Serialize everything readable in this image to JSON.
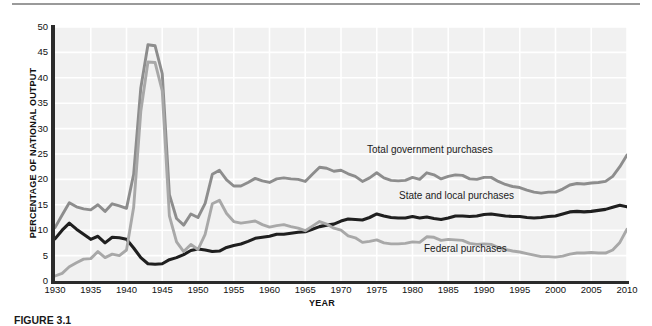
{
  "figure": {
    "caption": "FIGURE 3.1",
    "y_axis_title": "PERCENTAGE OF NATIONAL OUTPUT",
    "x_axis_title": "YEAR"
  },
  "colors": {
    "total_government": "#8d8d8d",
    "state_local": "#1f1f1f",
    "federal": "#a8a8a8",
    "plot_background": "#f1f1f1",
    "gridline": "#ffffff",
    "axis": "#2b2b2b"
  },
  "chart_data": {
    "type": "line",
    "title": "",
    "xlabel": "YEAR",
    "ylabel": "PERCENTAGE OF NATIONAL OUTPUT",
    "xlim": [
      1930,
      2010
    ],
    "ylim": [
      0,
      50
    ],
    "grid": true,
    "legend_position": "inline-annotations",
    "xticks": [
      1930,
      1935,
      1940,
      1945,
      1950,
      1955,
      1960,
      1965,
      1970,
      1975,
      1980,
      1985,
      1990,
      1995,
      2000,
      2005,
      2010
    ],
    "yticks": [
      0,
      5,
      10,
      15,
      20,
      25,
      30,
      35,
      40,
      45,
      50
    ],
    "x": [
      1930,
      1931,
      1932,
      1933,
      1934,
      1935,
      1936,
      1937,
      1938,
      1939,
      1940,
      1941,
      1942,
      1943,
      1944,
      1945,
      1946,
      1947,
      1948,
      1949,
      1950,
      1951,
      1952,
      1953,
      1954,
      1955,
      1956,
      1957,
      1958,
      1959,
      1960,
      1961,
      1962,
      1963,
      1964,
      1965,
      1966,
      1967,
      1968,
      1969,
      1970,
      1971,
      1972,
      1973,
      1974,
      1975,
      1976,
      1977,
      1978,
      1979,
      1980,
      1981,
      1982,
      1983,
      1984,
      1985,
      1986,
      1987,
      1988,
      1989,
      1990,
      1991,
      1992,
      1993,
      1994,
      1995,
      1996,
      1997,
      1998,
      1999,
      2000,
      2001,
      2002,
      2003,
      2004,
      2005,
      2006,
      2007,
      2008,
      2009,
      2010
    ],
    "series": [
      {
        "name": "Total government purchases",
        "color": "#8d8d8d",
        "values": [
          10.5,
          13.0,
          15.4,
          14.6,
          14.2,
          14.0,
          15.0,
          13.7,
          15.2,
          14.8,
          14.3,
          21.0,
          38.0,
          46.5,
          46.3,
          40.8,
          17.0,
          12.3,
          11.0,
          13.2,
          12.5,
          15.3,
          21.0,
          21.8,
          19.9,
          18.7,
          18.7,
          19.4,
          20.2,
          19.7,
          19.4,
          20.1,
          20.3,
          20.1,
          20.0,
          19.6,
          21.0,
          22.4,
          22.2,
          21.6,
          21.8,
          21.1,
          20.6,
          19.6,
          20.3,
          21.3,
          20.3,
          19.8,
          19.7,
          19.8,
          20.4,
          20.0,
          21.3,
          20.9,
          20.1,
          20.6,
          20.9,
          20.8,
          20.1,
          20.0,
          20.4,
          20.4,
          19.6,
          19.0,
          18.6,
          18.4,
          17.9,
          17.5,
          17.3,
          17.5,
          17.5,
          18.1,
          18.9,
          19.2,
          19.1,
          19.3,
          19.4,
          19.6,
          20.6,
          22.5,
          24.8
        ]
      },
      {
        "name": "State and local purchases",
        "color": "#1f1f1f",
        "values": [
          8.3,
          10.0,
          11.4,
          10.2,
          9.2,
          8.2,
          8.8,
          7.5,
          8.6,
          8.5,
          8.2,
          6.5,
          4.6,
          3.4,
          3.3,
          3.4,
          4.2,
          4.6,
          5.2,
          6.0,
          6.3,
          6.1,
          5.8,
          5.9,
          6.6,
          7.0,
          7.3,
          7.8,
          8.4,
          8.6,
          8.8,
          9.2,
          9.2,
          9.4,
          9.6,
          9.7,
          10.2,
          10.7,
          11.0,
          11.2,
          11.8,
          12.2,
          12.1,
          12.0,
          12.5,
          13.2,
          12.8,
          12.5,
          12.4,
          12.4,
          12.7,
          12.4,
          12.6,
          12.3,
          12.1,
          12.4,
          12.8,
          12.8,
          12.7,
          12.8,
          13.1,
          13.2,
          13.0,
          12.8,
          12.7,
          12.7,
          12.5,
          12.4,
          12.5,
          12.7,
          12.8,
          13.2,
          13.6,
          13.7,
          13.6,
          13.7,
          13.9,
          14.1,
          14.5,
          14.9,
          14.6
        ]
      },
      {
        "name": "Federal purchases",
        "color": "#a8a8a8",
        "values": [
          1.0,
          1.5,
          2.8,
          3.6,
          4.3,
          4.4,
          5.8,
          4.6,
          5.3,
          5.0,
          6.1,
          14.5,
          33.4,
          43.1,
          43.0,
          37.4,
          12.8,
          7.7,
          5.8,
          7.2,
          6.2,
          9.2,
          15.2,
          15.9,
          13.3,
          11.7,
          11.4,
          11.6,
          11.8,
          11.1,
          10.6,
          10.9,
          11.1,
          10.7,
          10.4,
          9.9,
          10.8,
          11.7,
          11.2,
          10.4,
          10.0,
          8.9,
          8.5,
          7.6,
          7.8,
          8.1,
          7.5,
          7.3,
          7.3,
          7.4,
          7.7,
          7.6,
          8.7,
          8.6,
          8.0,
          8.2,
          8.1,
          8.0,
          7.4,
          7.2,
          7.3,
          7.2,
          6.6,
          6.2,
          5.9,
          5.7,
          5.4,
          5.1,
          4.8,
          4.8,
          4.7,
          4.9,
          5.3,
          5.5,
          5.5,
          5.6,
          5.5,
          5.5,
          6.1,
          7.6,
          10.2
        ]
      }
    ],
    "annotations": [
      {
        "text": "Total government purchases",
        "x": 1978,
        "y": 27.5
      },
      {
        "text": "State and local purchases",
        "x": 1983,
        "y": 18.5
      },
      {
        "text": "Federal purchases",
        "x": 1986,
        "y": 8.0
      }
    ]
  }
}
